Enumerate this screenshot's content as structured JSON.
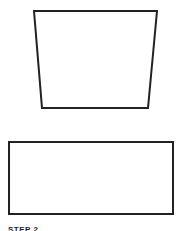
{
  "shapes": [
    {
      "type": "trapezoid",
      "points": [
        [
          34,
          11
        ],
        [
          157,
          11
        ],
        [
          148,
          108
        ],
        [
          42,
          108
        ]
      ],
      "stroke": "#222222",
      "stroke_width": 2,
      "fill": "#ffffff"
    },
    {
      "type": "rectangle",
      "x": 9,
      "y": 142,
      "width": 164,
      "height": 72,
      "stroke": "#222222",
      "stroke_width": 2,
      "fill": "#ffffff"
    }
  ],
  "caption": {
    "label": "STEP 2"
  }
}
